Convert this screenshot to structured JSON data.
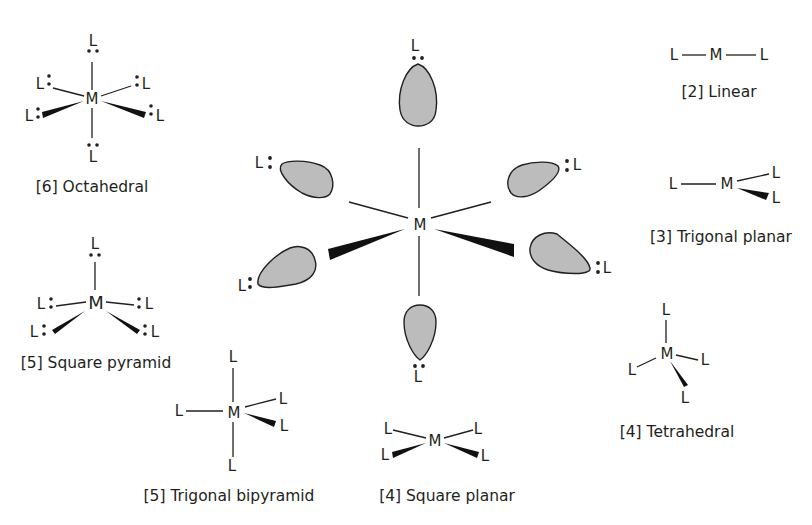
{
  "diagram": {
    "center": {
      "metal_label": "M",
      "ligand_label": "L",
      "description": "Six ligand lone pairs (shaded lobes) directed toward M"
    },
    "structures": [
      {
        "id": "octahedral",
        "caption": "[6] Octahedral",
        "metal": "M",
        "ligand": "L",
        "coordination_number": 6
      },
      {
        "id": "square-pyramid",
        "caption": "[5] Square pyramid",
        "metal": "M",
        "ligand": "L",
        "coordination_number": 5
      },
      {
        "id": "trigonal-bipyramid",
        "caption": "[5] Trigonal bipyramid",
        "metal": "M",
        "ligand": "L",
        "coordination_number": 5
      },
      {
        "id": "square-planar",
        "caption": "[4] Square planar",
        "metal": "M",
        "ligand": "L",
        "coordination_number": 4
      },
      {
        "id": "tetrahedral",
        "caption": "[4] Tetrahedral",
        "metal": "M",
        "ligand": "L",
        "coordination_number": 4
      },
      {
        "id": "trigonal-planar",
        "caption": "[3] Trigonal planar",
        "metal": "M",
        "ligand": "L",
        "coordination_number": 3
      },
      {
        "id": "linear",
        "caption": "[2] Linear",
        "metal": "M",
        "ligand": "L",
        "coordination_number": 2
      }
    ],
    "colors": {
      "ink": "#231f20",
      "lobe_fill": "#bcbcbc",
      "background": "#ffffff"
    }
  }
}
